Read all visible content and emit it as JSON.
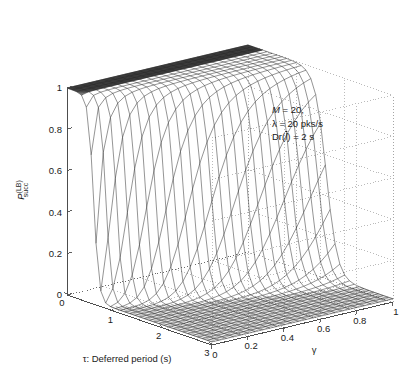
{
  "chart_data": {
    "type": "surface",
    "title": "",
    "xlabel": "τ: Deferred period (s)",
    "ylabel": "γ",
    "zlabel": "P_succ^(LB)",
    "xlim": [
      0,
      3
    ],
    "ylim": [
      0,
      1
    ],
    "zlim": [
      0,
      1
    ],
    "xticks": [
      "0",
      "1",
      "2",
      "3"
    ],
    "xtick_values": [
      0,
      1,
      2,
      3
    ],
    "yticks": [
      "0",
      "0.2",
      "0.4",
      "0.6",
      "0.8",
      "1"
    ],
    "ytick_values": [
      0,
      0.2,
      0.4,
      0.6,
      0.8,
      1
    ],
    "zticks": [
      "0",
      "0.2",
      "0.4",
      "0.6",
      "0.8",
      "1"
    ],
    "ztick_values": [
      0,
      0.2,
      0.4,
      0.6,
      0.8,
      1
    ],
    "grid": true,
    "grid_style": "dotted",
    "mesh_color": "#2b2b2b",
    "grid_color": "#9a9a9a",
    "axis_color": "#4d4d4d",
    "background": "#ffffff",
    "legend": "none",
    "annotations": [
      {
        "text": "M = 20,",
        "x": 0.62,
        "y": 0.88
      },
      {
        "text": "λ = 20 pks/s",
        "x": 0.62,
        "y": 0.82
      },
      {
        "text": "Dr(l̄) = 2 s",
        "x": 0.62,
        "y": 0.76
      }
    ],
    "surface_model": {
      "nx": 31,
      "ny": 26,
      "form": "P = 1 / (1 + exp((tau - tc(gamma)) / w(gamma)))",
      "tc_at_gamma0": 0.55,
      "tc_at_gamma1": 1.62,
      "tc_curve_power": 0.72,
      "width_at_gamma0": 0.055,
      "width_at_gamma1": 0.115,
      "floor": 0.015
    }
  },
  "axes": {
    "z_axis_name": "P-succ-LB",
    "x_axis_name": "tau-deferred-period",
    "y_axis_name": "gamma"
  },
  "annotation_block": {
    "line1_sym": "M",
    "line1_rest": " = 20,",
    "line2_sym": "λ",
    "line2_rest": " = 20 pks/s",
    "line3_pre": "Dr(",
    "line3_sym": "l",
    "line3_rest": ") = 2 s"
  }
}
